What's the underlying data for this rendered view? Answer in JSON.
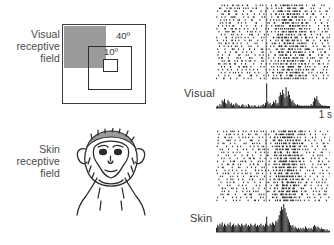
{
  "figure": {
    "accent_gray": "#9b9b9b",
    "ink": "#2e2e2e"
  },
  "left_column": {
    "visual_rf_label": "Visual receptive field",
    "skin_rf_label": "Skin receptive field",
    "visual_field_diagram": {
      "outer_extent_label": "40º",
      "inner_extent_label": "10º",
      "shaded_quadrant_color": "#9b9b9b",
      "shaded_quadrant_position": "upper-left"
    },
    "skin_field_diagram": {
      "subject": "macaque-monkey-face",
      "shaded_region": "top-of-head"
    }
  },
  "right_column": {
    "panels": [
      {
        "name": "visual-response-panel",
        "label": "Visual",
        "stimulus_onset_marker": true,
        "scalebar": {
          "label": "1 s",
          "shown": true
        }
      },
      {
        "name": "skin-response-panel",
        "label": "Skin",
        "stimulus_onset_marker": true,
        "scalebar": {
          "label": "1 s",
          "shown": false
        }
      }
    ]
  },
  "chart_data": [
    {
      "type": "scatter",
      "name": "visual-raster",
      "title": "Visual",
      "xlabel": "",
      "ylabel": "trial",
      "xlim": [
        0,
        100
      ],
      "ylim": [
        0,
        26
      ],
      "grid": false,
      "event_marker_x": 44,
      "trials": 26,
      "density_profile": {
        "x_bins": [
          0,
          5,
          10,
          15,
          20,
          25,
          30,
          35,
          40,
          45,
          50,
          55,
          60,
          65,
          70,
          75,
          80,
          85,
          90,
          95
        ],
        "spike_rate": [
          5,
          6,
          7,
          6,
          5,
          6,
          5,
          4,
          4,
          3,
          9,
          13,
          15,
          14,
          12,
          9,
          5,
          4,
          6,
          5
        ]
      }
    },
    {
      "type": "bar",
      "name": "visual-psth",
      "title": "Visual",
      "xlabel": "time",
      "ylabel": "spikes/bin",
      "xlim": [
        0,
        100
      ],
      "ylim": [
        0,
        20
      ],
      "grid": false,
      "event_marker_x": 44,
      "categories": [
        0,
        1,
        2,
        3,
        4,
        5,
        6,
        7,
        8,
        9,
        10,
        11,
        12,
        13,
        14,
        15,
        16,
        17,
        18,
        19,
        20,
        21,
        22,
        23,
        24,
        25,
        26,
        27,
        28,
        29,
        30,
        31,
        32,
        33,
        34,
        35,
        36,
        37,
        38,
        39,
        40,
        41,
        42,
        43,
        44,
        45,
        46,
        47,
        48,
        49,
        50,
        51,
        52,
        53,
        54,
        55,
        56,
        57,
        58,
        59,
        60,
        61,
        62,
        63,
        64,
        65,
        66,
        67,
        68,
        69,
        70,
        71,
        72,
        73,
        74,
        75,
        76,
        77,
        78,
        79,
        80,
        81,
        82,
        83,
        84,
        85,
        86,
        87,
        88,
        89,
        90,
        91,
        92,
        93,
        94,
        95,
        96,
        97,
        98,
        99
      ],
      "values": [
        1,
        2,
        1,
        3,
        2,
        6,
        5,
        7,
        4,
        3,
        6,
        5,
        3,
        4,
        2,
        3,
        2,
        4,
        3,
        2,
        2,
        1,
        2,
        3,
        2,
        1,
        2,
        1,
        3,
        2,
        1,
        2,
        1,
        2,
        2,
        1,
        1,
        2,
        1,
        2,
        2,
        3,
        2,
        4,
        19,
        5,
        3,
        4,
        2,
        3,
        5,
        4,
        6,
        3,
        4,
        9,
        12,
        10,
        14,
        11,
        8,
        16,
        9,
        13,
        10,
        7,
        5,
        6,
        4,
        3,
        2,
        3,
        2,
        2,
        1,
        2,
        1,
        2,
        1,
        2,
        1,
        2,
        1,
        3,
        2,
        5,
        8,
        7,
        9,
        6,
        4,
        3,
        2,
        2,
        1,
        2,
        1,
        1,
        1,
        1
      ]
    },
    {
      "type": "scatter",
      "name": "skin-raster",
      "title": "Skin",
      "xlabel": "",
      "ylabel": "trial",
      "xlim": [
        0,
        100
      ],
      "ylim": [
        0,
        24
      ],
      "grid": false,
      "event_marker_x": 44,
      "trials": 24,
      "density_profile": {
        "x_bins": [
          0,
          5,
          10,
          15,
          20,
          25,
          30,
          35,
          40,
          45,
          50,
          55,
          60,
          65,
          70,
          75,
          80,
          85,
          90,
          95
        ],
        "spike_rate": [
          4,
          5,
          6,
          5,
          4,
          5,
          6,
          5,
          4,
          4,
          12,
          16,
          18,
          15,
          10,
          6,
          4,
          4,
          5,
          4
        ]
      }
    },
    {
      "type": "bar",
      "name": "skin-psth",
      "title": "Skin",
      "xlabel": "time",
      "ylabel": "spikes/bin",
      "xlim": [
        0,
        100
      ],
      "ylim": [
        0,
        20
      ],
      "grid": false,
      "event_marker_x": 44,
      "categories": [
        0,
        1,
        2,
        3,
        4,
        5,
        6,
        7,
        8,
        9,
        10,
        11,
        12,
        13,
        14,
        15,
        16,
        17,
        18,
        19,
        20,
        21,
        22,
        23,
        24,
        25,
        26,
        27,
        28,
        29,
        30,
        31,
        32,
        33,
        34,
        35,
        36,
        37,
        38,
        39,
        40,
        41,
        42,
        43,
        44,
        45,
        46,
        47,
        48,
        49,
        50,
        51,
        52,
        53,
        54,
        55,
        56,
        57,
        58,
        59,
        60,
        61,
        62,
        63,
        64,
        65,
        66,
        67,
        68,
        69,
        70,
        71,
        72,
        73,
        74,
        75,
        76,
        77,
        78,
        79,
        80,
        81,
        82,
        83,
        84,
        85,
        86,
        87,
        88,
        89,
        90,
        91,
        92,
        93,
        94,
        95,
        96,
        97,
        98,
        99
      ],
      "values": [
        3,
        5,
        4,
        6,
        5,
        7,
        4,
        6,
        5,
        4,
        6,
        5,
        7,
        4,
        5,
        6,
        4,
        5,
        4,
        6,
        5,
        4,
        6,
        5,
        4,
        5,
        6,
        4,
        5,
        4,
        6,
        5,
        4,
        5,
        6,
        4,
        5,
        4,
        5,
        6,
        4,
        5,
        4,
        6,
        11,
        5,
        4,
        6,
        5,
        7,
        6,
        5,
        8,
        7,
        9,
        12,
        15,
        18,
        16,
        20,
        17,
        14,
        11,
        9,
        7,
        5,
        4,
        5,
        3,
        4,
        3,
        2,
        3,
        2,
        3,
        2,
        3,
        2,
        4,
        3,
        2,
        3,
        2,
        3,
        2,
        4,
        5,
        4,
        3,
        4,
        3,
        2,
        3,
        2,
        2,
        2,
        1,
        2,
        1,
        1
      ]
    }
  ]
}
